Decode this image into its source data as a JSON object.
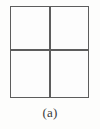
{
  "figure": {
    "caption": "(a)",
    "shape": {
      "name": "square-divided-into-four-quadrants",
      "rows": 2,
      "columns": 2,
      "quadrant_count": 4
    },
    "quadrants": [
      {
        "position": "top-left",
        "label": ""
      },
      {
        "position": "top-right",
        "label": ""
      },
      {
        "position": "bottom-left",
        "label": ""
      },
      {
        "position": "bottom-right",
        "label": ""
      }
    ],
    "colors": {
      "line": "#5d5d5d",
      "fill": "#fdfdfd",
      "background": "#fdfdfc",
      "caption_text": "#3a3a3a"
    }
  }
}
